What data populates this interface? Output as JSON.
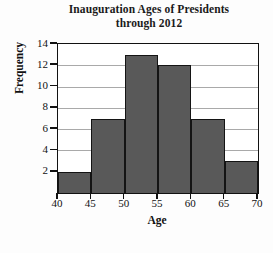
{
  "chart_data": {
    "type": "bar",
    "title": "Inauguration Ages of Presidents through 2012",
    "title_lines": [
      "Inauguration Ages of Presidents",
      "through 2012"
    ],
    "xlabel": "Age",
    "ylabel": "Frequency",
    "categories": [
      "40-45",
      "45-50",
      "50-55",
      "55-60",
      "60-65",
      "65-70"
    ],
    "bin_edges": [
      40,
      45,
      50,
      55,
      60,
      65,
      70
    ],
    "values": [
      2,
      7,
      13,
      12,
      7,
      3
    ],
    "xlim": [
      40,
      70
    ],
    "ylim": [
      0,
      14
    ],
    "xticks": [
      "40",
      "45",
      "50",
      "55",
      "60",
      "65",
      "70"
    ],
    "yticks": [
      "2",
      "4",
      "6",
      "8",
      "10",
      "12",
      "14"
    ],
    "grid": true,
    "legend": "none",
    "bar_color": "#595959",
    "bar_edge_color": "#141414",
    "grid_color": "#a9a9a9",
    "axis_color": "#111111",
    "plot_background": "#ffffff",
    "page_background": "#fdfdfd"
  }
}
